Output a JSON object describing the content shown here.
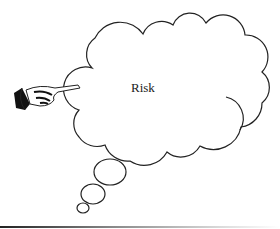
{
  "diagram": {
    "type": "thought-bubble",
    "label": "Risk",
    "pointer": "pointing-hand",
    "line_color": "#222222",
    "background": "#ffffff"
  }
}
